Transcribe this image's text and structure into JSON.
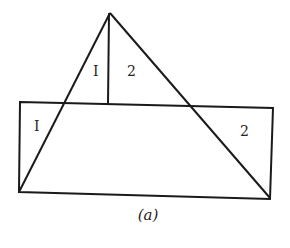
{
  "figure": {
    "caption": "(a)",
    "labels": [
      {
        "id": "triangle-left-region",
        "text": "I",
        "x": 96,
        "y": 76
      },
      {
        "id": "triangle-right-region",
        "text": "2",
        "x": 131,
        "y": 76
      },
      {
        "id": "rect-left-region",
        "text": "I",
        "x": 37,
        "y": 130
      },
      {
        "id": "rect-right-region",
        "text": "2",
        "x": 244,
        "y": 135
      }
    ],
    "stroke_color": "#1a1a1a",
    "background_color": "#ffffff"
  }
}
